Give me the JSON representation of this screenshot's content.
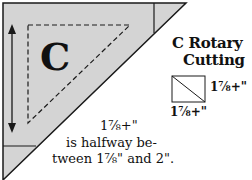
{
  "diagram": {
    "piece_label": "C",
    "title_line1": "C Rotary",
    "title_line2": "Cutting",
    "dimension_right": "1⅞+\"",
    "dimension_bottom": "1⅞+\"",
    "note_line1": "1⅞+\"",
    "note_line2": "is halfway be-",
    "note_line3": "tween 1⅞\" and 2\".",
    "colors": {
      "fill": "#d4d4d4",
      "stroke": "#1a1a1a",
      "background": "#ffffff"
    }
  }
}
